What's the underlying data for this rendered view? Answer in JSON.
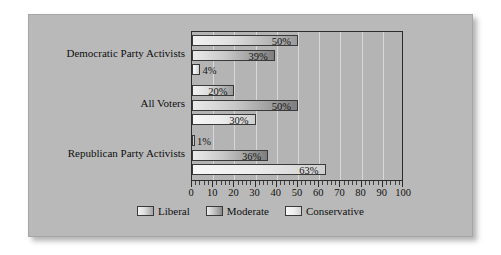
{
  "chart_data": {
    "type": "bar",
    "orientation": "horizontal",
    "title": "",
    "xlabel": "",
    "ylabel": "",
    "xlim": [
      0,
      100
    ],
    "xticks": [
      0,
      10,
      20,
      30,
      40,
      50,
      60,
      70,
      80,
      90,
      100
    ],
    "xticklabels": [
      "0",
      "10",
      "20",
      "30",
      "40",
      "50",
      "60",
      "70",
      "80",
      "90",
      "100"
    ],
    "grid": true,
    "grid_axis": "x",
    "legend_position": "bottom-center",
    "categories": [
      "Democratic Party Activists",
      "All Voters",
      "Republican Party Activists"
    ],
    "series": [
      {
        "name": "Liberal",
        "values": [
          50,
          20,
          1
        ],
        "labels": [
          "50%",
          "20%",
          "1%"
        ]
      },
      {
        "name": "Moderate",
        "values": [
          39,
          50,
          36
        ],
        "labels": [
          "39%",
          "50%",
          "36%"
        ]
      },
      {
        "name": "Conservative",
        "values": [
          4,
          30,
          63
        ],
        "labels": [
          "4%",
          "30%",
          "63%"
        ]
      }
    ],
    "bars": [
      {
        "group": "Democratic Party Activists",
        "series": "Liberal",
        "value": 50,
        "label": "50%",
        "label_placement": "inside"
      },
      {
        "group": "Democratic Party Activists",
        "series": "Moderate",
        "value": 39,
        "label": "39%",
        "label_placement": "inside"
      },
      {
        "group": "Democratic Party Activists",
        "series": "Conservative",
        "value": 4,
        "label": "4%",
        "label_placement": "outside"
      },
      {
        "group": "All Voters",
        "series": "Liberal",
        "value": 20,
        "label": "20%",
        "label_placement": "inside"
      },
      {
        "group": "All Voters",
        "series": "Moderate",
        "value": 50,
        "label": "50%",
        "label_placement": "inside"
      },
      {
        "group": "All Voters",
        "series": "Conservative",
        "value": 30,
        "label": "30%",
        "label_placement": "inside"
      },
      {
        "group": "Republican Party Activists",
        "series": "Liberal",
        "value": 1,
        "label": "1%",
        "label_placement": "outside"
      },
      {
        "group": "Republican Party Activists",
        "series": "Moderate",
        "value": 36,
        "label": "36%",
        "label_placement": "inside"
      },
      {
        "group": "Republican Party Activists",
        "series": "Conservative",
        "value": 63,
        "label": "63%",
        "label_placement": "inside"
      }
    ],
    "colors": {
      "panel_background": "#b9b9b9",
      "plot_background": "#b4b4b4",
      "gridline": "#d8d8d8",
      "axis": "#2c2c2c",
      "text": "#101010"
    }
  },
  "legend": {
    "items": [
      {
        "label": "Liberal",
        "key": "liberal"
      },
      {
        "label": "Moderate",
        "key": "moderate"
      },
      {
        "label": "Conservative",
        "key": "conservative"
      }
    ]
  }
}
